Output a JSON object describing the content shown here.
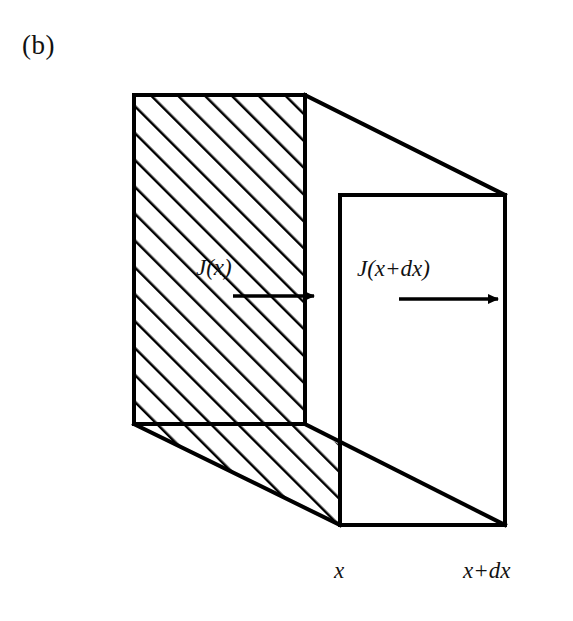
{
  "figure": {
    "panel_letter": "(b)",
    "background_color": "#ffffff",
    "ink_color": "#000000"
  },
  "labels": {
    "flux_in": "J(x)",
    "flux_out": "J(x+dx)",
    "position_left": "x",
    "position_right": "x+dx"
  },
  "geometry": {
    "back_face": {
      "name": "hatched-back-face",
      "corners": [
        [
          134,
          95
        ],
        [
          305,
          95
        ],
        [
          305,
          424
        ],
        [
          134,
          424
        ]
      ],
      "hatched": true,
      "hatch_angle_deg": 45,
      "hatch_spacing_px": 19,
      "hatch_line_width_px": 5
    },
    "front_face": {
      "name": "clear-front-face",
      "corners": [
        [
          340,
          195
        ],
        [
          505,
          195
        ],
        [
          505,
          525
        ],
        [
          340,
          525
        ]
      ],
      "hatched": false
    },
    "depth_offset": [
      206,
      100
    ],
    "connector_edges": [
      [
        [
          305,
          95
        ],
        [
          505,
          195
        ]
      ],
      [
        [
          134,
          424
        ],
        [
          340,
          525
        ]
      ],
      [
        [
          305,
          424
        ],
        [
          505,
          525
        ]
      ]
    ],
    "stroke_width_px": 4
  },
  "arrows": {
    "flux_in_arrow": {
      "name": "flux-in-arrow",
      "x1": 233,
      "y1": 296,
      "x2": 318,
      "y2": 296,
      "direction": "right"
    },
    "flux_out_arrow": {
      "name": "flux-out-arrow",
      "x1": 399,
      "y1": 299,
      "x2": 502,
      "y2": 299,
      "direction": "right"
    }
  },
  "axis_ticks": {
    "left_tick_x": 340,
    "right_tick_x": 505
  }
}
